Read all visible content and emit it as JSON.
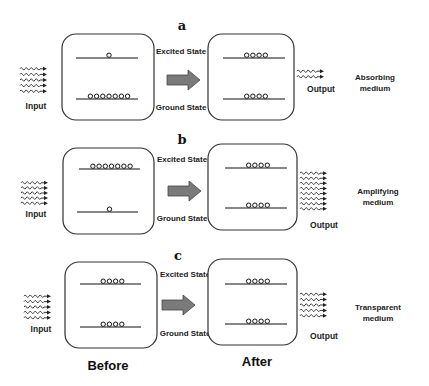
{
  "figure": {
    "column_labels": {
      "before": "Before",
      "after": "After"
    },
    "arrow_icon": "right-arrow",
    "wave_icon": "wavy-arrow",
    "atom_icon": "circle",
    "panels": [
      {
        "letter": "a",
        "excited_label": "Excited State",
        "ground_label": "Ground State",
        "input_label": "Input",
        "output_label": "Output",
        "medium_label_line1": "Absorbing",
        "medium_label_line2": "medium",
        "input_photons": 5,
        "output_photons": 2,
        "before": {
          "excited_atoms": 1,
          "ground_atoms": 7
        },
        "after": {
          "excited_atoms": 4,
          "ground_atoms": 4
        }
      },
      {
        "letter": "b",
        "excited_label": "Excited State",
        "ground_label": "Ground State",
        "input_label": "Input",
        "output_label": "Output",
        "medium_label_line1": "Amplifying",
        "medium_label_line2": "medium",
        "input_photons": 5,
        "output_photons": 8,
        "before": {
          "excited_atoms": 7,
          "ground_atoms": 1
        },
        "after": {
          "excited_atoms": 4,
          "ground_atoms": 4
        }
      },
      {
        "letter": "c",
        "excited_label": "Excited State",
        "ground_label": "Ground State",
        "input_label": "Input",
        "output_label": "Output",
        "medium_label_line1": "Transparent",
        "medium_label_line2": "medium",
        "input_photons": 5,
        "output_photons": 5,
        "before": {
          "excited_atoms": 4,
          "ground_atoms": 4
        },
        "after": {
          "excited_atoms": 4,
          "ground_atoms": 4
        }
      }
    ]
  }
}
